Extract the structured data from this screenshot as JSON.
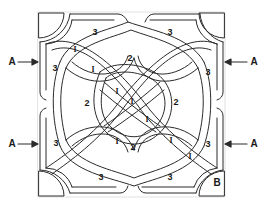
{
  "diagram": {
    "title": "",
    "type": "celtic-knot-panel",
    "colors": {
      "line": "#2a2a2a",
      "fill": "#ffffff",
      "text": "#1a1a1a"
    },
    "arrow_labels": [
      {
        "id": "left-top",
        "text": "A",
        "x": 12,
        "y": 62
      },
      {
        "id": "right-top",
        "text": "A",
        "x": 254,
        "y": 62
      },
      {
        "id": "left-bottom",
        "text": "A",
        "x": 12,
        "y": 144
      },
      {
        "id": "right-bottom",
        "text": "A",
        "x": 254,
        "y": 144
      }
    ],
    "corner_label": {
      "text": "B",
      "x": 217,
      "y": 183
    },
    "region_labels": [
      {
        "text": "3",
        "x": 95,
        "y": 32,
        "cls": "n3"
      },
      {
        "text": "3",
        "x": 170,
        "y": 32,
        "cls": "n3"
      },
      {
        "text": "3",
        "x": 55,
        "y": 68,
        "cls": "n3"
      },
      {
        "text": "3",
        "x": 208,
        "y": 72,
        "cls": "n3"
      },
      {
        "text": "3",
        "x": 56,
        "y": 143,
        "cls": "n3"
      },
      {
        "text": "3",
        "x": 208,
        "y": 144,
        "cls": "n3"
      },
      {
        "text": "3",
        "x": 101,
        "y": 177,
        "cls": "n3"
      },
      {
        "text": "3",
        "x": 170,
        "y": 177,
        "cls": "n3"
      },
      {
        "text": "2",
        "x": 130,
        "y": 58,
        "cls": "n2"
      },
      {
        "text": "2",
        "x": 87,
        "y": 103,
        "cls": "n2"
      },
      {
        "text": "2",
        "x": 176,
        "y": 102,
        "cls": "n2"
      },
      {
        "text": "2",
        "x": 133,
        "y": 147,
        "cls": "n2"
      },
      {
        "text": "I",
        "x": 75,
        "y": 50,
        "cls": "n1"
      },
      {
        "text": "I",
        "x": 93,
        "y": 70,
        "cls": "n1"
      },
      {
        "text": "I",
        "x": 117,
        "y": 92,
        "cls": "n1"
      },
      {
        "text": "I",
        "x": 132,
        "y": 102,
        "cls": "n1"
      },
      {
        "text": "I",
        "x": 147,
        "y": 120,
        "cls": "n1"
      },
      {
        "text": "I",
        "x": 117,
        "y": 142,
        "cls": "n1"
      },
      {
        "text": "I",
        "x": 171,
        "y": 141,
        "cls": "n1"
      },
      {
        "text": "I",
        "x": 190,
        "y": 157,
        "cls": "n1"
      }
    ]
  }
}
